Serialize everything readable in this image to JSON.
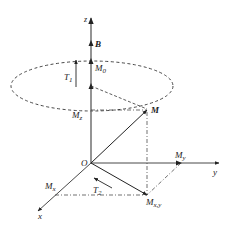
{
  "diagram": {
    "type": "magnetization-vector-3d",
    "labels": {
      "z_axis": "z",
      "y_axis": "y",
      "x_axis": "x",
      "origin": "O",
      "field": "B",
      "m0": {
        "main": "M",
        "sub": "0"
      },
      "mz": {
        "main": "M",
        "sub": "z"
      },
      "m": "M",
      "my": {
        "main": "M",
        "sub": "y"
      },
      "mx": {
        "main": "M",
        "sub": "x"
      },
      "mxy": {
        "main": "M",
        "sub": "x,y"
      },
      "t1": {
        "main": "T",
        "sub": "1"
      },
      "t2": {
        "main": "T",
        "sub": "2"
      }
    },
    "colors": {
      "axis": "#555555",
      "line": "#222222",
      "text": "#222222"
    }
  }
}
